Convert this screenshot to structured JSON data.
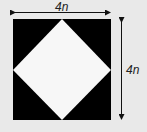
{
  "diagram": {
    "type": "square with inscribed rotated square (diamond)",
    "outer_square": {
      "fill": "#000000"
    },
    "inner_diamond": {
      "fill": "#f7f7f7"
    },
    "background": "#e9e9e9",
    "width_label": "4n",
    "height_label": "4n"
  }
}
